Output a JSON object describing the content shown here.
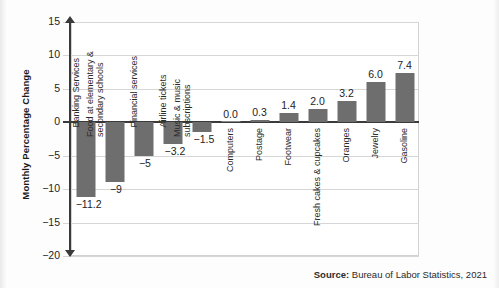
{
  "chart_data": {
    "type": "bar",
    "title": "",
    "subtitle": "",
    "xlabel": "",
    "ylabel": "Monthly Percentage Change",
    "ylim": [
      -20,
      15
    ],
    "yticks": [
      15,
      10,
      5,
      0,
      -5,
      -10,
      -15,
      -20
    ],
    "ytick_labels": [
      "15",
      "10",
      "5",
      "0",
      "−5",
      "−10",
      "−15",
      "−20"
    ],
    "grid": true,
    "legend": false,
    "legend_position": "none",
    "orientation": "vertical",
    "bar_color": "#6e6e6e",
    "categories": [
      "Banking Services",
      "Food at elementary & secondary schools",
      "Financial services",
      "Airline tickets",
      "Music & music subscriptions",
      "Computers",
      "Postage",
      "Footwear",
      "Fresh cakes & cupcakes",
      "Oranges",
      "Jewelry",
      "Gasoline"
    ],
    "values": [
      -11.2,
      -9,
      -5,
      -3.2,
      -1.5,
      0.0,
      0.3,
      1.4,
      2.0,
      3.2,
      6.0,
      7.4
    ],
    "value_labels": [
      "−11.2",
      "−9",
      "−5",
      "−3.2",
      "−1.5",
      "0.0",
      "0.3",
      "1.4",
      "2.0",
      "3.2",
      "6.0",
      "7.4"
    ],
    "annotations": [
      "Source: Bureau of Labor Statistics, 2021"
    ]
  },
  "axis": {
    "y_title": "Monthly Percentage Change"
  },
  "source": {
    "prefix": "Source:",
    "text": " Bureau of Labor Statistics, 2021"
  },
  "category_lines": [
    [
      "Banking Services"
    ],
    [
      "Food at elementary &",
      "secondary schools"
    ],
    [
      "Financial services"
    ],
    [
      "Airline tickets"
    ],
    [
      "Music & music",
      "subscriptions"
    ],
    [
      "Computers"
    ],
    [
      "Postage"
    ],
    [
      "Footwear"
    ],
    [
      "Fresh cakes & cupcakes"
    ],
    [
      "Oranges"
    ],
    [
      "Jewelry"
    ],
    [
      "Gasoline"
    ]
  ]
}
